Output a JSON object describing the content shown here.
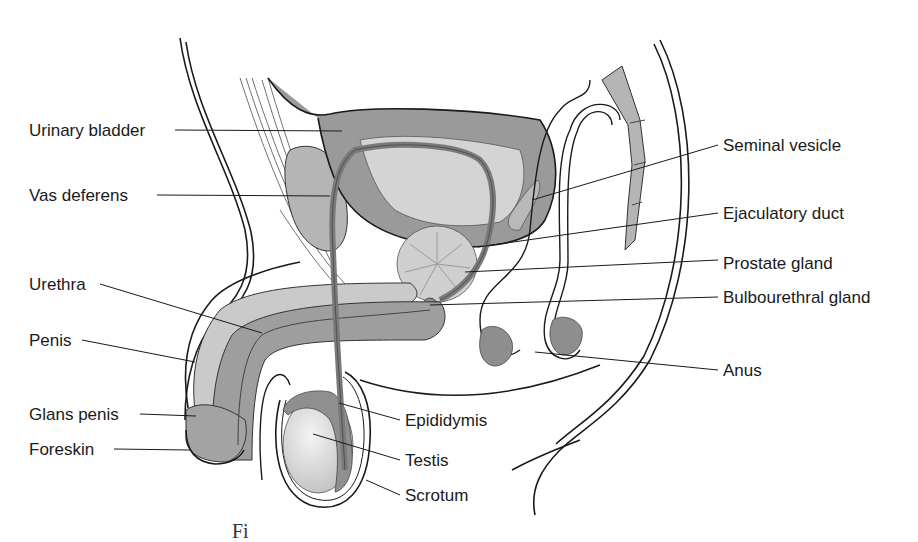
{
  "diagram": {
    "style": {
      "outline": "#1a1a1a",
      "tissue_dark": "#8a8a8a",
      "tissue_mid": "#a9a9a9",
      "tissue_light": "#cfcfcf",
      "background": "#ffffff"
    },
    "labels_left": [
      {
        "id": "urinary-bladder",
        "text": "Urinary bladder"
      },
      {
        "id": "vas-deferens",
        "text": "Vas deferens"
      },
      {
        "id": "urethra",
        "text": "Urethra"
      },
      {
        "id": "penis",
        "text": "Penis"
      },
      {
        "id": "glans-penis",
        "text": "Glans penis"
      },
      {
        "id": "foreskin",
        "text": "Foreskin"
      }
    ],
    "labels_right": [
      {
        "id": "seminal-vesicle",
        "text": "Seminal vesicle"
      },
      {
        "id": "ejaculatory-duct",
        "text": "Ejaculatory duct"
      },
      {
        "id": "prostate-gland",
        "text": "Prostate gland"
      },
      {
        "id": "bulbourethral-gland",
        "text": "Bulbourethral gland"
      },
      {
        "id": "anus",
        "text": "Anus"
      }
    ],
    "labels_bottom": [
      {
        "id": "epididymis",
        "text": "Epididymis"
      },
      {
        "id": "testis",
        "text": "Testis"
      },
      {
        "id": "scrotum",
        "text": "Scrotum"
      }
    ],
    "caption_fragment": "Fi"
  }
}
